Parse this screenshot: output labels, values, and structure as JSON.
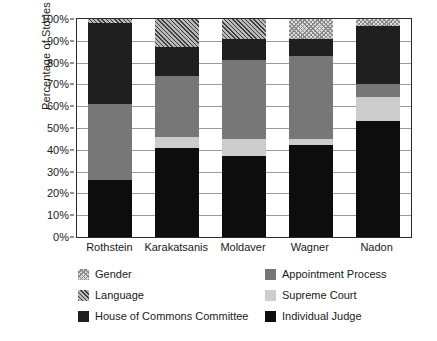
{
  "chart_data": {
    "type": "bar",
    "stacked": true,
    "title": "",
    "xlabel": "",
    "ylabel": "Percentage of Stories",
    "ylim": [
      0,
      100
    ],
    "ytick_labels": [
      "0%",
      "10%",
      "20%",
      "30%",
      "40%",
      "50%",
      "60%",
      "70%",
      "80%",
      "90%",
      "100%"
    ],
    "ytick_values": [
      0,
      10,
      20,
      30,
      40,
      50,
      60,
      70,
      80,
      90,
      100
    ],
    "grid": true,
    "legend_position": "below",
    "categories": [
      "Rothstein",
      "Karakatsanis",
      "Moldaver",
      "Wagner",
      "Nadon"
    ],
    "series": [
      {
        "name": "Individual Judge",
        "pattern": "solid-black",
        "color": "#0d0d0d",
        "values": [
          26,
          41,
          37,
          42,
          53
        ]
      },
      {
        "name": "Supreme Court",
        "pattern": "solid-light",
        "color": "#cccccc",
        "values": [
          0,
          5,
          8,
          3,
          11
        ]
      },
      {
        "name": "Appointment Process",
        "pattern": "solid-medium",
        "color": "#777777",
        "values": [
          35,
          28,
          36,
          38,
          6
        ]
      },
      {
        "name": "House of Commons Committee",
        "pattern": "solid-dark",
        "color": "#1f1f1f",
        "values": [
          37,
          13,
          10,
          8,
          27
        ]
      },
      {
        "name": "Language",
        "pattern": "diagonal-hatch",
        "color": "#b9b9b9",
        "values": [
          2,
          13,
          9,
          0,
          0
        ]
      },
      {
        "name": "Gender",
        "pattern": "dotted-light",
        "color": "#dcdcdc",
        "values": [
          0,
          0,
          0,
          9,
          3
        ]
      }
    ],
    "cumulative_tops": {
      "Rothstein": {
        "Individual Judge": 26,
        "Supreme Court": 26,
        "Appointment Process": 61,
        "House of Commons Committee": 98,
        "Language": 100,
        "Gender": 100
      },
      "Karakatsanis": {
        "Individual Judge": 41,
        "Supreme Court": 46,
        "Appointment Process": 74,
        "House of Commons Committee": 87,
        "Language": 100,
        "Gender": 100
      },
      "Moldaver": {
        "Individual Judge": 37,
        "Supreme Court": 45,
        "Appointment Process": 81,
        "House of Commons Committee": 91,
        "Language": 100,
        "Gender": 100
      },
      "Wagner": {
        "Individual Judge": 42,
        "Supreme Court": 45,
        "Appointment Process": 83,
        "House of Commons Committee": 91,
        "Language": 91,
        "Gender": 100
      },
      "Nadon": {
        "Individual Judge": 53,
        "Supreme Court": 64,
        "Appointment Process": 70,
        "House of Commons Committee": 97,
        "Language": 97,
        "Gender": 100
      }
    }
  },
  "legend": {
    "items": [
      {
        "label": "Gender",
        "swatch": "gender-swatch"
      },
      {
        "label": "Appointment Process",
        "swatch": "appointment-process-swatch"
      },
      {
        "label": "Language",
        "swatch": "language-swatch"
      },
      {
        "label": "Supreme Court",
        "swatch": "supreme-court-swatch"
      },
      {
        "label": "House of Commons Committee",
        "swatch": "house-of-commons-committee-swatch"
      },
      {
        "label": "Individual Judge",
        "swatch": "individual-judge-swatch"
      }
    ]
  }
}
